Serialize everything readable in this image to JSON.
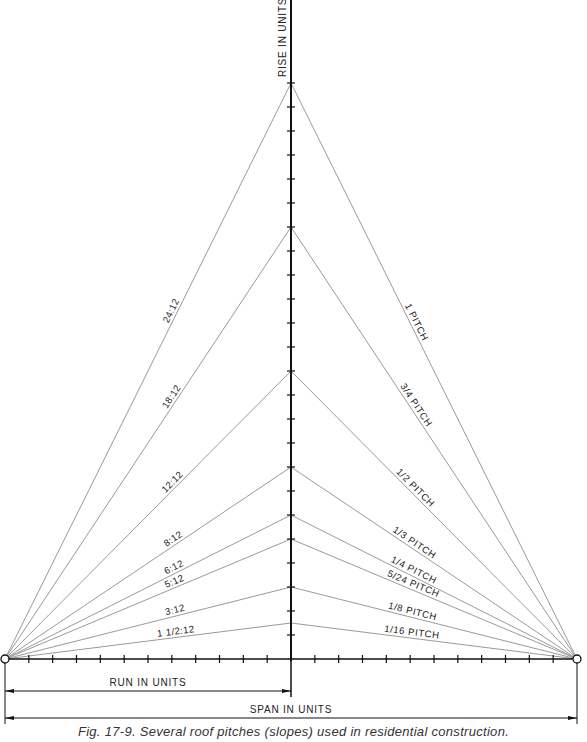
{
  "figure": {
    "caption": "Fig. 17-9. Several roof pitches (slopes) used in residential construction.",
    "axis_labels": {
      "rise": "RISE IN UNITS",
      "run": "RUN IN UNITS",
      "span": "SPAN IN UNITS"
    },
    "geometry": {
      "axis_x": 291,
      "baseline_y": 659,
      "left_x": 5,
      "right_x": 577,
      "unit_px": 24,
      "run_units": 12
    },
    "pitches": [
      {
        "rise": 24,
        "slope_label": "24:12",
        "pitch_label": "1 PITCH"
      },
      {
        "rise": 18,
        "slope_label": "18:12",
        "pitch_label": "3/4 PITCH"
      },
      {
        "rise": 12,
        "slope_label": "12:12",
        "pitch_label": "1/2 PITCH"
      },
      {
        "rise": 8,
        "slope_label": "8:12",
        "pitch_label": "1/3 PITCH"
      },
      {
        "rise": 6,
        "slope_label": "6:12",
        "pitch_label": "1/4 PITCH"
      },
      {
        "rise": 5,
        "slope_label": "5:12",
        "pitch_label": "5/24 PITCH"
      },
      {
        "rise": 3,
        "slope_label": "3:12",
        "pitch_label": "1/8 PITCH"
      },
      {
        "rise": 1.5,
        "slope_label": "1  1/2:12",
        "pitch_label": "1/16 PITCH"
      }
    ],
    "colors": {
      "axis": "#111111",
      "pitch_line": "#9a9a9a",
      "text": "#222222"
    }
  }
}
